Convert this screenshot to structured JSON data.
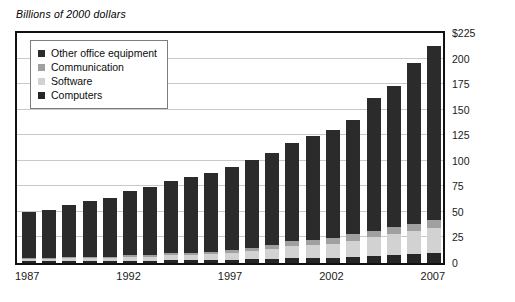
{
  "chart_data": {
    "type": "bar",
    "subtype": "stacked-bar",
    "title": "Billions of 2000 dollars",
    "xlabel": "",
    "ylabel": "",
    "ylim": [
      0,
      225
    ],
    "ytick_step": 25,
    "grid": true,
    "legend_position": "top-left inside plot",
    "yticks": [
      "0",
      "25",
      "50",
      "75",
      "100",
      "125",
      "150",
      "175",
      "200",
      "$225"
    ],
    "categories": [
      1987,
      1988,
      1989,
      1990,
      1991,
      1992,
      1993,
      1994,
      1995,
      1996,
      1997,
      1998,
      1999,
      2000,
      2001,
      2002,
      2003,
      2004,
      2005,
      2006,
      2007
    ],
    "xtick_labels": [
      "1987",
      "1992",
      "1997",
      "2002",
      "2007"
    ],
    "xtick_categories": [
      1987,
      1992,
      1997,
      2002,
      2007
    ],
    "series": [
      {
        "name": "Computers",
        "color": "#262626",
        "values": [
          2,
          2,
          2,
          2,
          2,
          2,
          2,
          3,
          3,
          3,
          3,
          4,
          4,
          5,
          5,
          5,
          6,
          7,
          8,
          9,
          10
        ]
      },
      {
        "name": "Software",
        "color": "#d2d2d2",
        "values": [
          2,
          2,
          3,
          3,
          3,
          4,
          4,
          5,
          5,
          6,
          7,
          8,
          10,
          12,
          13,
          14,
          16,
          18,
          20,
          22,
          24
        ]
      },
      {
        "name": "Communication",
        "color": "#a0a0a0",
        "values": [
          1,
          1,
          1,
          1,
          1,
          2,
          2,
          2,
          2,
          2,
          3,
          3,
          4,
          5,
          5,
          5,
          6,
          6,
          7,
          7,
          8
        ]
      },
      {
        "name": "Other office equipment",
        "color": "#2b2b2b",
        "values": [
          45,
          47,
          51,
          55,
          58,
          62,
          66,
          70,
          74,
          77,
          81,
          86,
          90,
          95,
          101,
          106,
          112,
          130,
          138,
          158,
          170
        ]
      }
    ],
    "totals": [
      50,
      52,
      57,
      61,
      64,
      70,
      74,
      80,
      84,
      88,
      94,
      101,
      108,
      117,
      124,
      130,
      140,
      161,
      173,
      196,
      212
    ],
    "legend": [
      {
        "label": "Other office equipment",
        "color": "#2b2b2b"
      },
      {
        "label": "Communication",
        "color": "#a0a0a0"
      },
      {
        "label": "Software",
        "color": "#d2d2d2"
      },
      {
        "label": "Computers",
        "color": "#262626"
      }
    ],
    "colors": {
      "grid": "#c9c9c9",
      "frame": "#111111",
      "text": "#1a1a1a",
      "background": "#ffffff"
    }
  }
}
